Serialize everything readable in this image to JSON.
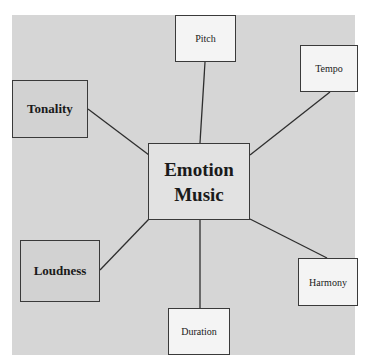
{
  "diagram": {
    "center": {
      "line1": "Emotion",
      "line2": "Music"
    },
    "nodes": {
      "pitch": "Pitch",
      "tempo": "Tempo",
      "tonality": "Tonality",
      "loudness": "Loudness",
      "harmony": "Harmony",
      "duration": "Duration"
    },
    "colors": {
      "background": "#d6d6d6",
      "light_box": "#f4f4f4",
      "dark_box": "#d2d2d2",
      "center_box": "#e2e2e2",
      "border": "#3a3a3a"
    }
  }
}
